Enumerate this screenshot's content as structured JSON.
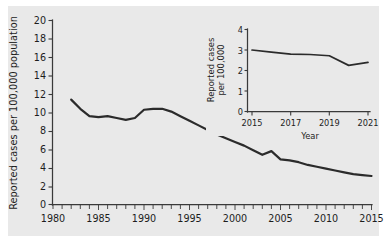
{
  "chart_data": [
    {
      "id": "main",
      "type": "line",
      "title": "",
      "xlabel": "",
      "ylabel": "Reported cases per 100,000 population",
      "xlim": [
        1980,
        2015
      ],
      "ylim": [
        0,
        20
      ],
      "ytick_step": 2,
      "xtick_step": 5,
      "minor_xtick_step": 1,
      "grid": false,
      "legend": "none",
      "xticks": [
        "1980",
        "1985",
        "1990",
        "1995",
        "2000",
        "2005",
        "2010",
        "2015"
      ],
      "yticks": [
        "0",
        "2",
        "4",
        "6",
        "8",
        "10",
        "12",
        "14",
        "16",
        "18",
        "20"
      ],
      "x": [
        1982,
        1983,
        1984,
        1985,
        1986,
        1987,
        1988,
        1989,
        1990,
        1991,
        1992,
        1993,
        1994,
        1995,
        1996,
        1997,
        1998,
        1999,
        2000,
        2001,
        2002,
        2003,
        2004,
        2005,
        2006,
        2007,
        2008,
        2009,
        2010,
        2011,
        2012,
        2013,
        2014,
        2015
      ],
      "values": [
        11.4,
        10.4,
        9.6,
        9.5,
        9.6,
        9.4,
        9.2,
        9.4,
        10.3,
        10.4,
        10.4,
        10.1,
        9.6,
        9.1,
        8.6,
        8.1,
        7.6,
        7.2,
        6.8,
        6.4,
        5.9,
        5.4,
        5.8,
        4.9,
        4.8,
        4.6,
        4.3,
        4.1,
        3.9,
        3.7,
        3.5,
        3.3,
        3.2,
        3.1
      ]
    },
    {
      "id": "inset",
      "type": "line",
      "title": "",
      "xlabel": "Year",
      "ylabel": "Reported cases per 100,000",
      "ylabel_line1": "Reported cases",
      "ylabel_line2": "per 100,000",
      "xlim": [
        2015,
        2021
      ],
      "ylim": [
        0,
        4
      ],
      "ytick_step": 1,
      "xtick_step": 2,
      "grid": false,
      "legend": "none",
      "xticks": [
        "2015",
        "2017",
        "2019",
        "2021"
      ],
      "yticks": [
        "0",
        "1",
        "2",
        "3",
        "4"
      ],
      "x": [
        2015,
        2016,
        2017,
        2018,
        2019,
        2020,
        2021
      ],
      "values": [
        3.0,
        2.9,
        2.8,
        2.78,
        2.72,
        2.25,
        2.4
      ]
    }
  ],
  "colors": {
    "figure_background": "#ffffff",
    "plot_background": "#e9e9e9",
    "line": "#2b2b2b",
    "axis": "#3a3a3a",
    "text": "#1d1d1d"
  }
}
